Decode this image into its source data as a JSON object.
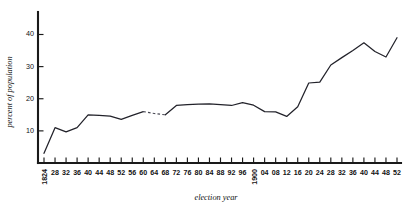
{
  "chart_data": {
    "type": "line",
    "title": "",
    "subtitle": "",
    "xlabel": "election year",
    "ylabel": "percent of population",
    "grid": false,
    "legend": false,
    "legend_position": "none",
    "xlim": [
      1824,
      1952
    ],
    "ylim": [
      0,
      47
    ],
    "yticks": [
      10,
      20,
      30,
      40
    ],
    "ytick_labels": [
      "10",
      "20",
      "30",
      "40"
    ],
    "xticks": [
      1824,
      1828,
      1832,
      1836,
      1840,
      1844,
      1848,
      1852,
      1856,
      1860,
      1864,
      1868,
      1872,
      1876,
      1880,
      1884,
      1888,
      1892,
      1896,
      1900,
      1904,
      1908,
      1912,
      1916,
      1920,
      1924,
      1928,
      1932,
      1936,
      1940,
      1944,
      1948,
      1952
    ],
    "xtick_labels": [
      "1824",
      "28",
      "32",
      "36",
      "40",
      "44",
      "48",
      "52",
      "56",
      "60",
      "64",
      "68",
      "72",
      "76",
      "80",
      "84",
      "88",
      "92",
      "96",
      "1900",
      "04",
      "08",
      "12",
      "16",
      "20",
      "24",
      "28",
      "32",
      "36",
      "40",
      "44",
      "48",
      "52"
    ],
    "xtick_rotated": [
      true,
      false,
      false,
      false,
      false,
      false,
      false,
      false,
      false,
      false,
      false,
      false,
      false,
      false,
      false,
      false,
      false,
      false,
      false,
      true,
      false,
      false,
      false,
      false,
      false,
      false,
      false,
      false,
      false,
      false,
      false,
      false,
      false
    ],
    "x": [
      1824,
      1828,
      1832,
      1836,
      1840,
      1844,
      1848,
      1852,
      1856,
      1860,
      1864,
      1868,
      1872,
      1876,
      1880,
      1884,
      1888,
      1892,
      1896,
      1900,
      1904,
      1908,
      1912,
      1916,
      1920,
      1924,
      1928,
      1932,
      1936,
      1940,
      1944,
      1948,
      1952
    ],
    "values": [
      3.0,
      11.0,
      9.7,
      11.0,
      15.0,
      14.8,
      14.6,
      13.6,
      14.8,
      16.0,
      15.4,
      15.0,
      17.9,
      18.2,
      18.3,
      18.4,
      18.2,
      17.9,
      18.8,
      18.0,
      16.0,
      15.9,
      14.5,
      17.5,
      24.9,
      25.2,
      30.5,
      32.8,
      35.0,
      37.4,
      34.7,
      33.0,
      39.0
    ],
    "dashed_segment": {
      "from_year": 1860,
      "to_year": 1868,
      "note": "interpolated / uncertain data"
    },
    "series": [
      {
        "name": "percent of population voting",
        "values": [
          3.0,
          11.0,
          9.7,
          11.0,
          15.0,
          14.8,
          14.6,
          13.6,
          14.8,
          16.0,
          15.4,
          15.0,
          17.9,
          18.2,
          18.3,
          18.4,
          18.2,
          17.9,
          18.8,
          18.0,
          16.0,
          15.9,
          14.5,
          17.5,
          24.9,
          25.2,
          30.5,
          32.8,
          35.0,
          37.4,
          34.7,
          33.0,
          39.0
        ],
        "color": "#22222a"
      }
    ]
  },
  "colors": {
    "line": "#22222a",
    "dashed_line": "#4a4a56",
    "axis": "#1a1a1a",
    "background": "#ffffff",
    "text": "#111111"
  }
}
